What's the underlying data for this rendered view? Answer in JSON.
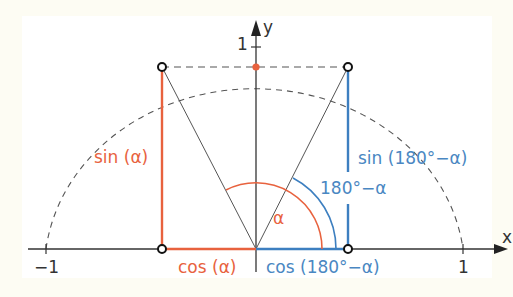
{
  "colors": {
    "red": "#e8623e",
    "blue": "#3d7fc0",
    "axis": "#333333",
    "dashed": "#555555"
  },
  "axes": {
    "x_label": "x",
    "y_label": "y",
    "tick_neg1": "−1",
    "tick_pos1_x": "1",
    "tick_pos1_y": "1"
  },
  "labels": {
    "sin_alpha": "sin (α)",
    "cos_alpha": "cos (α)",
    "sin_180_minus_alpha": "sin (180°−α)",
    "cos_180_minus_alpha": "cos (180°−α)",
    "alpha": "α",
    "angle_180_minus_alpha": "180°−α"
  }
}
